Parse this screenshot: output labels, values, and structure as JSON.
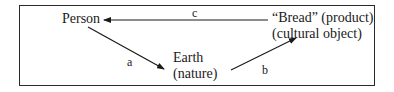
{
  "diagram": {
    "nodes": {
      "person": {
        "label": "Person"
      },
      "earth": {
        "line1": "Earth",
        "line2": "(nature)"
      },
      "bread": {
        "line1": "“Bread” (product)",
        "line2": "(cultural object)"
      }
    },
    "edges": {
      "a": {
        "label": "a",
        "from": "Person",
        "to": "Earth (nature)"
      },
      "b": {
        "label": "b",
        "from": "Earth (nature)",
        "to": "“Bread” (product)"
      },
      "c": {
        "label": "c",
        "from": "“Bread” (product)",
        "to": "Person"
      }
    },
    "colors": {
      "ink": "#1a1a1a",
      "frame": "#2a2a2a",
      "background": "#ffffff"
    }
  }
}
